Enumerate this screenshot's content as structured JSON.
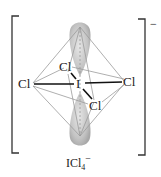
{
  "diagram": {
    "central_atom": "I",
    "ligands": [
      "Cl",
      "Cl",
      "Cl",
      "Cl"
    ],
    "charge": "−",
    "formula": {
      "base": "ICl",
      "subscript": "4",
      "superscript": "−"
    },
    "lone_pairs": 2,
    "colors": {
      "lobe": "#c8c8c8",
      "bond": "#111111",
      "edge": "#9a9a9a",
      "bracket": "#333333"
    }
  }
}
